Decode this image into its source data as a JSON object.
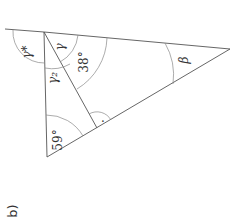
{
  "figure": {
    "part_label": "b)",
    "angles": {
      "gamma_star": "γ*",
      "gamma": "γ",
      "gamma_2": "γ₂",
      "top_right": "38°",
      "bottom_left": "59°",
      "beta": "β",
      "right_angle_dot": "·"
    }
  }
}
